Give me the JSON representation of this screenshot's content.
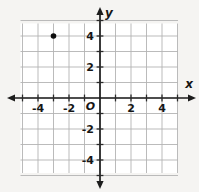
{
  "chart_data": {
    "type": "scatter",
    "points": [
      {
        "x": -3,
        "y": 4
      }
    ],
    "xlabel": "x",
    "ylabel": "y",
    "origin_label": "O",
    "xlim": [
      -5,
      5
    ],
    "ylim": [
      -5,
      5
    ],
    "grid": true,
    "x_ticks": [
      {
        "value": -4,
        "label": "-4"
      },
      {
        "value": -2,
        "label": "-2"
      },
      {
        "value": 2,
        "label": "2"
      },
      {
        "value": 4,
        "label": "4"
      }
    ],
    "y_ticks": [
      {
        "value": 4,
        "label": "4"
      },
      {
        "value": 2,
        "label": "2"
      },
      {
        "value": -2,
        "label": "-2"
      },
      {
        "value": -4,
        "label": "-4"
      }
    ],
    "colors": {
      "outer_bg": "#f5f4f2",
      "plot_bg": "#ffffff",
      "grid": "#b3b3b3",
      "axis": "#1c1c1c",
      "tick": "#2a2a2a",
      "text": "#161616",
      "point": "#0d0d0d"
    }
  }
}
